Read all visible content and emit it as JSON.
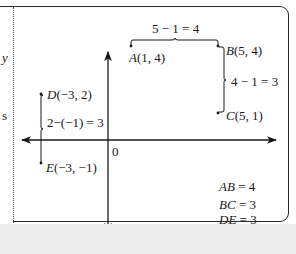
{
  "figure": {
    "margin_text": [
      "y",
      "s"
    ],
    "origin_label": "0",
    "points": [
      {
        "id": "A",
        "name": "A",
        "coords": "(1, 4)"
      },
      {
        "id": "B",
        "name": "B",
        "coords": "(5, 4)"
      },
      {
        "id": "C",
        "name": "C",
        "coords": "(5, 1)"
      },
      {
        "id": "D",
        "name": "D",
        "coords": "(−3, 2)"
      },
      {
        "id": "E",
        "name": "E",
        "coords": "(−3, −1)"
      }
    ],
    "distance_annotations": {
      "ab": "5 − 1 = 4",
      "bc": "4 − 1 = 3",
      "de": "2−(−1) = 3"
    },
    "results": [
      {
        "seg": "AB",
        "value": "= 4"
      },
      {
        "seg": "BC",
        "value": "= 3"
      },
      {
        "seg": "DE",
        "value": "= 3"
      }
    ]
  }
}
